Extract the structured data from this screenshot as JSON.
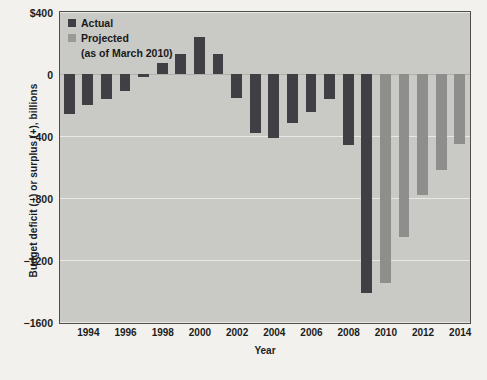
{
  "chart_data": {
    "type": "bar",
    "title": "",
    "xlabel": "Year",
    "ylabel": "Budget deficit (−) or surplus (+), billions",
    "ylim": [
      -1600,
      400
    ],
    "yticks": [
      400,
      0,
      -400,
      -800,
      -1200,
      -1600
    ],
    "ytick_labels": [
      "$400",
      "0",
      "−400",
      "−800",
      "−1200",
      "−1600"
    ],
    "xticks": [
      1994,
      1996,
      1998,
      2000,
      2002,
      2004,
      2006,
      2008,
      2010,
      2012,
      2014
    ],
    "xtick_labels": [
      "1994",
      "1996",
      "1998",
      "2000",
      "2002",
      "2004",
      "2006",
      "2008",
      "2010",
      "2012",
      "2014"
    ],
    "grid": true,
    "legend_position": "top-left",
    "series": [
      {
        "name": "Actual",
        "color": "#3f3f44",
        "points": [
          {
            "year": 1993,
            "value": -255
          },
          {
            "year": 1994,
            "value": -203
          },
          {
            "year": 1995,
            "value": -164
          },
          {
            "year": 1996,
            "value": -107
          },
          {
            "year": 1997,
            "value": -22
          },
          {
            "year": 1998,
            "value": 69
          },
          {
            "year": 1999,
            "value": 126
          },
          {
            "year": 2000,
            "value": 236
          },
          {
            "year": 2001,
            "value": 128
          },
          {
            "year": 2002,
            "value": -158
          },
          {
            "year": 2003,
            "value": -378
          },
          {
            "year": 2004,
            "value": -413
          },
          {
            "year": 2005,
            "value": -318
          },
          {
            "year": 2006,
            "value": -248
          },
          {
            "year": 2007,
            "value": -161
          },
          {
            "year": 2008,
            "value": -459
          },
          {
            "year": 2009,
            "value": -1413
          }
        ]
      },
      {
        "name": "Projected",
        "color": "#8e8e8c",
        "sublabel": "(as of March 2010)",
        "points": [
          {
            "year": 2010,
            "value": -1350
          },
          {
            "year": 2011,
            "value": -1050
          },
          {
            "year": 2012,
            "value": -780
          },
          {
            "year": 2013,
            "value": -620
          },
          {
            "year": 2014,
            "value": -450
          }
        ]
      }
    ]
  },
  "legend": {
    "actual_label": "Actual",
    "projected_label": "Projected",
    "projected_sublabel": "(as of March 2010)"
  }
}
